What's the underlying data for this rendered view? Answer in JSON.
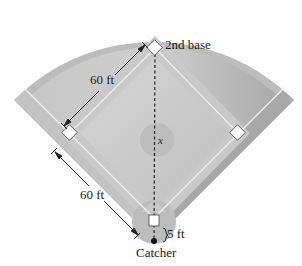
{
  "diagram": {
    "labels": {
      "second_base": "2nd base",
      "side_length_upper": "60 ft",
      "side_length_lower": "60 ft",
      "distance_variable": "x",
      "catcher_offset": "5 ft",
      "catcher": "Catcher"
    },
    "bases": [
      "Home plate",
      "1st base",
      "2nd base",
      "3rd base"
    ],
    "measurements": {
      "base_path_ft": 60,
      "catcher_behind_home_ft": 5
    },
    "colors": {
      "outer_field": "#bdbdbd",
      "outfield_inner": "#c8c8c8",
      "infield": "#d3d3d3",
      "lines": "#f0f0f0",
      "bases": "#ffffff",
      "text": "#1a1a1a"
    }
  }
}
